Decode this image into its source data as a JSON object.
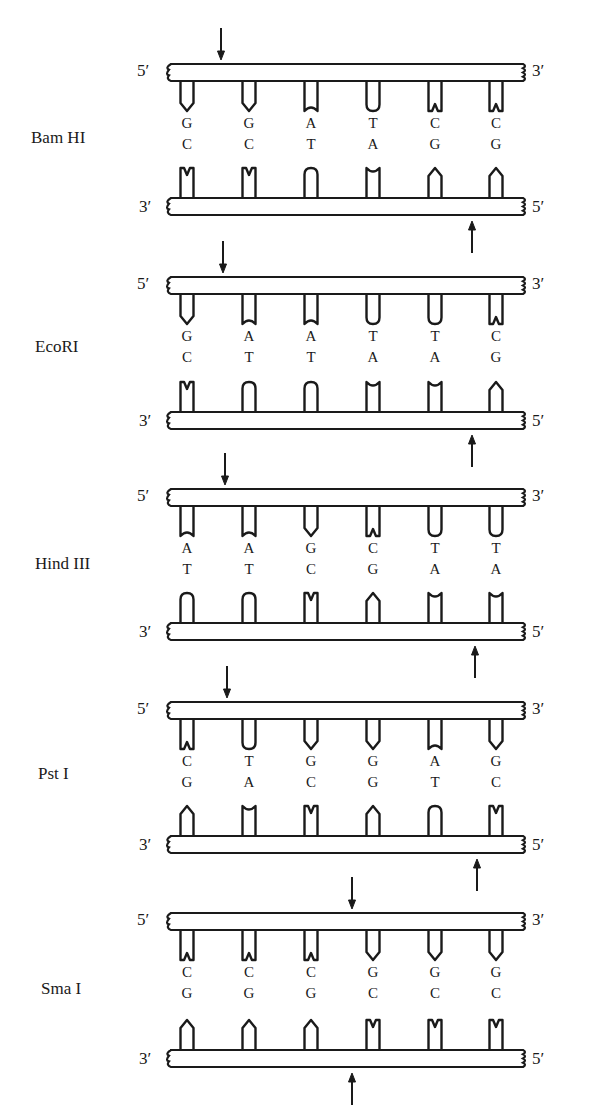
{
  "figure": {
    "title": "",
    "columns_x": [
      187,
      249,
      311,
      373,
      435,
      496
    ],
    "strand_left": 167,
    "strand_right": 523,
    "stroke_color": "#1a1a1a",
    "fill_color": "#ffffff",
    "base_shapes": {
      "G": "pointed",
      "C": "w-notch",
      "A": "concave",
      "T": "rounded"
    }
  },
  "enzymes": [
    {
      "name": "Bam HI",
      "label_x": 31,
      "label_y": 128,
      "top_strand_y": 64,
      "bottom_strand_y": 198,
      "top_seq": [
        "G",
        "G",
        "A",
        "T",
        "C",
        "C"
      ],
      "bottom_seq": [
        "C",
        "C",
        "T",
        "A",
        "G",
        "G"
      ],
      "top_5_label": "5′",
      "top_3_label": "3′",
      "bottom_3_label": "3′",
      "bottom_5_label": "5′",
      "top_cut_x": 221,
      "bottom_cut_x": 472
    },
    {
      "name": "EcoRI",
      "label_x": 35,
      "label_y": 337,
      "top_strand_y": 277,
      "bottom_strand_y": 412,
      "top_seq": [
        "G",
        "A",
        "A",
        "T",
        "T",
        "C"
      ],
      "bottom_seq": [
        "C",
        "T",
        "T",
        "A",
        "A",
        "G"
      ],
      "top_5_label": "5′",
      "top_3_label": "3′",
      "bottom_3_label": "3′",
      "bottom_5_label": "5′",
      "top_cut_x": 223,
      "bottom_cut_x": 472
    },
    {
      "name": "Hind III",
      "label_x": 35,
      "label_y": 554,
      "top_strand_y": 489,
      "bottom_strand_y": 623,
      "top_seq": [
        "A",
        "A",
        "G",
        "C",
        "T",
        "T"
      ],
      "bottom_seq": [
        "T",
        "T",
        "C",
        "G",
        "A",
        "A"
      ],
      "top_5_label": "5′",
      "top_3_label": "3′",
      "bottom_3_label": "3′",
      "bottom_5_label": "5′",
      "top_cut_x": 225,
      "bottom_cut_x": 475
    },
    {
      "name": "Pst I",
      "label_x": 38,
      "label_y": 764,
      "top_strand_y": 702,
      "bottom_strand_y": 836,
      "top_seq": [
        "C",
        "T",
        "G",
        "G",
        "A",
        "G"
      ],
      "bottom_seq": [
        "G",
        "A",
        "C",
        "G",
        "T",
        "C"
      ],
      "top_5_label": "5′",
      "top_3_label": "3′",
      "bottom_3_label": "3′",
      "bottom_5_label": "5′",
      "top_cut_x": 227,
      "bottom_cut_x": 477
    },
    {
      "name": "Sma I",
      "label_x": 41,
      "label_y": 979,
      "top_strand_y": 913,
      "bottom_strand_y": 1050,
      "top_seq": [
        "C",
        "C",
        "C",
        "G",
        "G",
        "G"
      ],
      "bottom_seq": [
        "G",
        "G",
        "G",
        "C",
        "C",
        "C"
      ],
      "top_5_label": "5′",
      "top_3_label": "3′",
      "bottom_3_label": "3′",
      "bottom_5_label": "5′",
      "top_cut_x": 352,
      "bottom_cut_x": 352
    }
  ]
}
